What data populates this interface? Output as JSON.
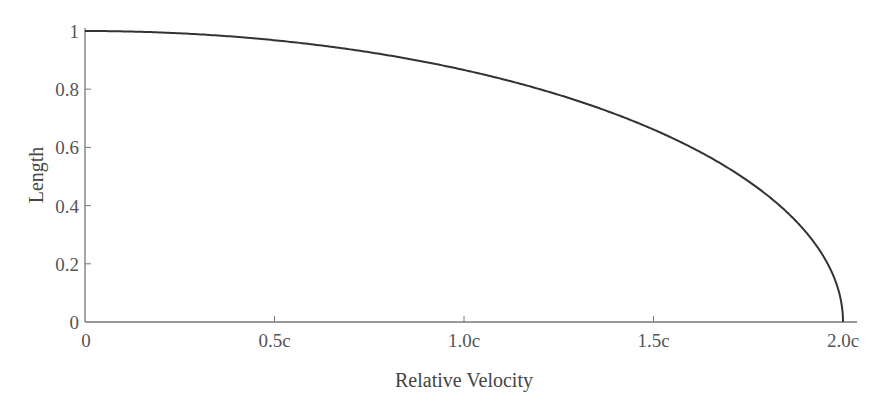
{
  "chart_data": {
    "type": "line",
    "title": "",
    "xlabel": "Relative Velocity",
    "ylabel": "Length",
    "x_tick_labels": [
      "0",
      "0.5c",
      "1.0c",
      "1.5c",
      "2.0c"
    ],
    "x_ticks": [
      0,
      0.5,
      1.0,
      1.5,
      2.0
    ],
    "y_tick_labels": [
      "0",
      "0.2",
      "0.4",
      "0.6",
      "0.8",
      "1"
    ],
    "y_ticks": [
      0,
      0.2,
      0.4,
      0.6,
      0.8,
      1.0
    ],
    "xlim": [
      0,
      2.0
    ],
    "ylim": [
      0,
      1.0
    ],
    "grid": false,
    "legend": null,
    "series": [
      {
        "name": "Length",
        "color": "#333333",
        "x": [
          0,
          0.1,
          0.2,
          0.3,
          0.4,
          0.5,
          0.6,
          0.7,
          0.8,
          0.9,
          1.0,
          1.1,
          1.2,
          1.3,
          1.4,
          1.5,
          1.6,
          1.7,
          1.8,
          1.9,
          1.95,
          1.98,
          2.0
        ],
        "y": [
          1.0,
          0.999,
          0.995,
          0.989,
          0.98,
          0.968,
          0.954,
          0.937,
          0.917,
          0.893,
          0.866,
          0.835,
          0.8,
          0.76,
          0.714,
          0.661,
          0.6,
          0.527,
          0.436,
          0.312,
          0.222,
          0.141,
          0.0
        ]
      }
    ]
  },
  "colors": {
    "axis": "#777777",
    "curve": "#333333",
    "text": "#555555"
  }
}
